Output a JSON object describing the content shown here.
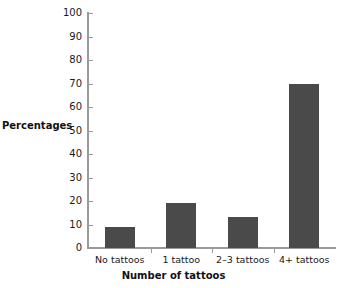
{
  "chart_data": {
    "type": "bar",
    "title": "",
    "categories": [
      "No tattoos",
      "1 tattoo",
      "2–3 tattoos",
      "4+ tattoos"
    ],
    "values": [
      9,
      19,
      13,
      70
    ],
    "xlabel": "Number of tattoos",
    "ylabel": "Percentages",
    "ylim": [
      0,
      100
    ],
    "yticks": [
      0,
      10,
      20,
      30,
      40,
      50,
      60,
      70,
      80,
      90,
      100
    ],
    "ytick_labels": [
      "0",
      "10",
      "20",
      "30",
      "40",
      "50",
      "60",
      "70",
      "80",
      "90",
      "100"
    ],
    "grid": false,
    "legend": false,
    "legend_position": "none",
    "bar_color": "#4a4a4a",
    "axis_color": "#9a9a9a",
    "background_color": "#ffffff"
  },
  "axes": {
    "y_title": "Percentages",
    "x_title": "Number of tattoos"
  }
}
